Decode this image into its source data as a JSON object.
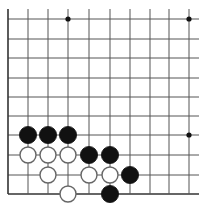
{
  "board": {
    "title": "Go board diagram (lower-left corner)",
    "colors": {
      "background": "#ffffff",
      "line": "#555555",
      "edge": "#333333",
      "black": "#111111",
      "white_fill": "#ffffff",
      "white_stroke": "#666666"
    },
    "columns_x": [
      8,
      28,
      48,
      68,
      89,
      110,
      130,
      150,
      169,
      189
    ],
    "rows_y": [
      19,
      39,
      58,
      78,
      97,
      116,
      135,
      155,
      175,
      194
    ],
    "edges": {
      "left": true,
      "bottom": true,
      "top": false,
      "right": false
    },
    "hoshi": [
      {
        "col": 3,
        "row": 0
      },
      {
        "col": 9,
        "row": 0
      },
      {
        "col": 9,
        "row": 6
      }
    ],
    "stones": [
      {
        "color": "black",
        "col": 1,
        "row": 6
      },
      {
        "color": "black",
        "col": 2,
        "row": 6
      },
      {
        "color": "black",
        "col": 3,
        "row": 6
      },
      {
        "color": "white",
        "col": 1,
        "row": 7
      },
      {
        "color": "white",
        "col": 2,
        "row": 7
      },
      {
        "color": "white",
        "col": 3,
        "row": 7
      },
      {
        "color": "black",
        "col": 4,
        "row": 7
      },
      {
        "color": "black",
        "col": 5,
        "row": 7
      },
      {
        "color": "white",
        "col": 2,
        "row": 8
      },
      {
        "color": "white",
        "col": 4,
        "row": 8
      },
      {
        "color": "white",
        "col": 5,
        "row": 8
      },
      {
        "color": "black",
        "col": 6,
        "row": 8
      },
      {
        "color": "white",
        "col": 3,
        "row": 9
      },
      {
        "color": "black",
        "col": 5,
        "row": 9
      }
    ]
  }
}
